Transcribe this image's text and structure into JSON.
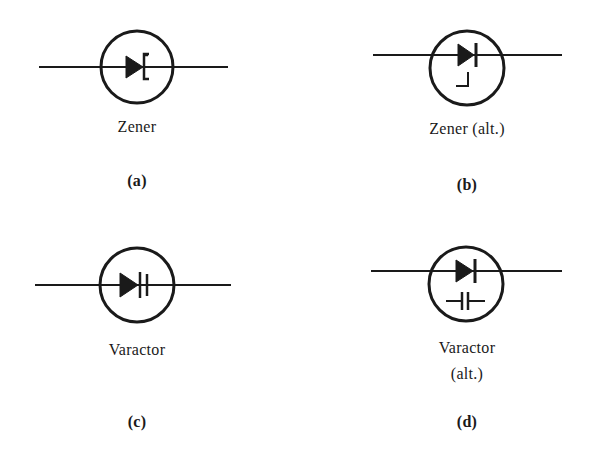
{
  "figure": {
    "panels": [
      {
        "id": "a",
        "name": "Zener",
        "name_lines": [
          "Zener"
        ],
        "caption": "(a)",
        "symbol": "zener-diode"
      },
      {
        "id": "b",
        "name": "Zener (alt.)",
        "name_lines": [
          "Zener (alt.)"
        ],
        "caption": "(b)",
        "symbol": "zener-diode-alt"
      },
      {
        "id": "c",
        "name": "Varactor",
        "name_lines": [
          "Varactor"
        ],
        "caption": "(c)",
        "symbol": "varactor-diode"
      },
      {
        "id": "d",
        "name": "Varactor (alt.)",
        "name_lines": [
          "Varactor",
          "(alt.)"
        ],
        "caption": "(d)",
        "symbol": "varactor-diode-alt"
      }
    ],
    "colors": {
      "ink": "#1a1a1a",
      "background": "#ffffff"
    }
  }
}
